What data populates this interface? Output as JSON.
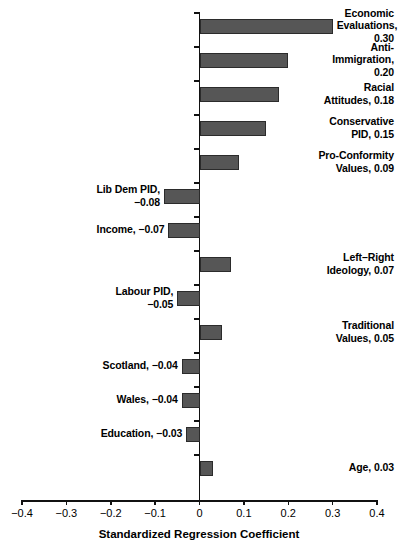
{
  "chart_data": {
    "type": "bar",
    "orientation": "horizontal",
    "title": "",
    "xlabel": "Standardized Regression Coefficient",
    "ylabel": "",
    "xlim": [
      -0.4,
      0.4
    ],
    "xticks": [
      -0.4,
      -0.3,
      -0.2,
      -0.1,
      0,
      0.1,
      0.2,
      0.3,
      0.4
    ],
    "xtick_labels": [
      "−0.4",
      "−0.3",
      "−0.2",
      "−0.1",
      "0",
      "0.1",
      "0.2",
      "0.3",
      "0.4"
    ],
    "grid": false,
    "legend": null,
    "bar_color": "#565656",
    "bar_edge_color": "#2b2b2b",
    "categories": [
      "Economic Evaluations",
      "Anti-Immigration",
      "Racial Attitudes",
      "Conservative PID",
      "Pro-Conformity Values",
      "Lib Dem PID",
      "Income",
      "Left–Right Ideology",
      "Labour PID",
      "Traditional Values",
      "Scotland",
      "Wales",
      "Education",
      "Age"
    ],
    "values": [
      0.3,
      0.2,
      0.18,
      0.15,
      0.09,
      -0.08,
      -0.07,
      0.07,
      -0.05,
      0.05,
      -0.04,
      -0.04,
      -0.03,
      0.03
    ],
    "annotations": [
      "Economic\nEvaluations,\n0.30",
      "Anti-\nImmigration,\n0.20",
      "Racial\nAttitudes, 0.18",
      "Conservative\nPID, 0.15",
      "Pro-Conformity\nValues, 0.09",
      "Lib Dem PID,\n−0.08",
      "Income, −0.07",
      "Left–Right\nIdeology, 0.07",
      "Labour PID,\n−0.05",
      "Traditional\nValues, 0.05",
      "Scotland, −0.04",
      "Wales, −0.04",
      "Education, −0.03",
      "Age, 0.03"
    ]
  }
}
